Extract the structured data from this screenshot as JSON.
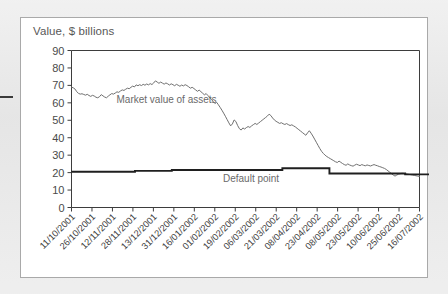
{
  "figure": {
    "title": "Value, $ billions"
  },
  "chart_data": {
    "type": "line",
    "title": "Value, $ billions",
    "xlabel": "",
    "ylabel": "Value, $ billions",
    "ylim": [
      0,
      90
    ],
    "ytick_step": 10,
    "yticks": [
      0,
      10,
      20,
      30,
      40,
      50,
      60,
      70,
      80,
      90
    ],
    "grid": false,
    "legend": "inline-annotations",
    "annotations": [
      {
        "name": "market-value-annotation",
        "text": "Market value of assets",
        "x_index": 2.2,
        "y_value": 60
      },
      {
        "name": "default-point-annotation",
        "text": "Default point",
        "x_index": 7.4,
        "y_value": 14.5
      }
    ],
    "xticks": [
      "11/10/2001",
      "26/10/2001",
      "12/11/2001",
      "28/11/2001",
      "13/12/2001",
      "31/12/2001",
      "16/01/2002",
      "01/02/2002",
      "19/02/2002",
      "06/03/2002",
      "21/03/2002",
      "08/04/2002",
      "23/04/2002",
      "08/05/2002",
      "23/05/2002",
      "10/06/2002",
      "25/06/2002",
      "16/07/2002"
    ],
    "series": [
      {
        "name": "Market value of assets",
        "color": "#707070",
        "style": "thin-line",
        "values": [
          69.0,
          68.6,
          67.9,
          66.4,
          65.4,
          65.0,
          65.2,
          64.8,
          64.4,
          64.9,
          64.2,
          63.7,
          64.3,
          63.9,
          63.2,
          62.9,
          63.5,
          64.7,
          64.0,
          63.3,
          62.9,
          63.8,
          64.6,
          65.3,
          65.0,
          65.6,
          66.3,
          66.0,
          66.8,
          67.4,
          67.1,
          67.8,
          68.4,
          68.1,
          68.9,
          69.6,
          69.1,
          70.3,
          69.8,
          70.4,
          69.9,
          70.6,
          70.1,
          70.8,
          70.3,
          71.0,
          70.5,
          71.4,
          72.6,
          71.9,
          71.2,
          71.9,
          71.3,
          70.7,
          71.4,
          70.9,
          70.2,
          70.9,
          70.4,
          69.8,
          70.6,
          70.1,
          69.5,
          70.2,
          69.7,
          70.4,
          69.9,
          69.2,
          68.4,
          68.9,
          68.2,
          67.4,
          66.6,
          67.3,
          66.4,
          65.5,
          64.6,
          65.3,
          64.2,
          63.1,
          62.0,
          60.8,
          59.6,
          60.3,
          58.9,
          57.4,
          55.8,
          54.1,
          52.3,
          50.4,
          48.5,
          46.8,
          47.9,
          50.2,
          49.3,
          47.0,
          45.2,
          44.4,
          45.6,
          45.0,
          45.8,
          46.4,
          45.9,
          46.8,
          47.5,
          48.2,
          47.6,
          48.4,
          49.2,
          50.0,
          50.8,
          51.6,
          52.4,
          53.5,
          52.7,
          51.3,
          50.2,
          49.4,
          48.8,
          48.2,
          48.6,
          48.0,
          47.6,
          48.1,
          47.5,
          47.0,
          47.4,
          46.8,
          46.2,
          45.4,
          44.6,
          43.8,
          43.0,
          42.2,
          41.4,
          42.8,
          44.0,
          42.6,
          41.0,
          39.2,
          37.4,
          35.6,
          33.8,
          32.2,
          31.0,
          30.0,
          29.2,
          28.6,
          28.0,
          27.4,
          26.8,
          26.2,
          25.8,
          26.6,
          25.9,
          25.2,
          24.6,
          24.2,
          25.0,
          24.4,
          24.0,
          23.7,
          24.3,
          24.8,
          24.4,
          24.0,
          24.6,
          24.2,
          23.9,
          24.4,
          24.1,
          23.8,
          24.2,
          24.6,
          24.2,
          23.9,
          23.5,
          23.2,
          22.8,
          22.4,
          21.8,
          21.0,
          20.2,
          19.4,
          18.6,
          18.0,
          18.6,
          19.1,
          19.4,
          19.6,
          19.5,
          19.3,
          19.2,
          19.0,
          18.8,
          18.6,
          18.4,
          18.2,
          18.0,
          17.8
        ]
      },
      {
        "name": "Default point",
        "color": "#1f1f1f",
        "style": "thick-step-line",
        "steps": [
          {
            "x_index": 0.0,
            "value": 20.5
          },
          {
            "x_index": 3.1,
            "value": 21.0
          },
          {
            "x_index": 4.9,
            "value": 21.5
          },
          {
            "x_index": 10.3,
            "value": 22.5
          },
          {
            "x_index": 12.6,
            "value": 19.5
          },
          {
            "x_index": 16.3,
            "value": 19.0
          },
          {
            "x_index": 17.6,
            "value": 19.0
          }
        ]
      }
    ]
  }
}
